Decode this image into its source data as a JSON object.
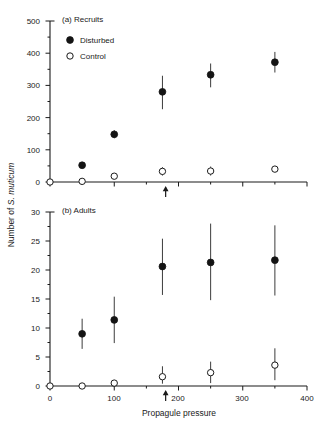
{
  "figure": {
    "xlabel": "Propagule pressure",
    "ylabel_prefix": "Number of ",
    "ylabel_species": "S. muticum",
    "legend": {
      "disturbed": "Disturbed",
      "control": "Control"
    },
    "colors": {
      "axis": "#1a1a1a",
      "disturbed_fill": "#141414",
      "control_fill": "#ffffff",
      "control_stroke": "#1a1a1a",
      "error_bar": "#3c3c3c",
      "background": "#ffffff"
    }
  },
  "chart_data": [
    {
      "type": "scatter",
      "panel": "a",
      "title": "(a) Recruits",
      "xlabel": "Propagule pressure",
      "ylabel": "Number of S. muticum",
      "xlim": [
        0,
        400
      ],
      "ylim": [
        0,
        500
      ],
      "xticks": [
        0,
        50,
        100,
        150,
        200,
        250,
        300,
        350,
        400
      ],
      "xticklabels": [
        "0",
        "",
        "100",
        "",
        "200",
        "",
        "300",
        "",
        "400"
      ],
      "yticks": [
        0,
        50,
        100,
        150,
        200,
        250,
        300,
        350,
        400,
        450,
        500
      ],
      "yticklabels": [
        "0",
        "",
        "100",
        "",
        "200",
        "",
        "300",
        "",
        "400",
        "",
        "500"
      ],
      "grid": false,
      "legend_position": "upper-left",
      "annotation_arrow_x": 180,
      "series": [
        {
          "name": "Disturbed",
          "marker": "filled-circle",
          "x": [
            50,
            100,
            175,
            250,
            350
          ],
          "values": [
            52,
            148,
            280,
            333,
            372
          ],
          "err_low": [
            44,
            136,
            226,
            294,
            340
          ],
          "err_high": [
            60,
            161,
            330,
            368,
            404
          ]
        },
        {
          "name": "Control",
          "marker": "open-circle",
          "x": [
            0,
            50,
            100,
            175,
            250,
            350
          ],
          "values": [
            0,
            2,
            18,
            33,
            34,
            40
          ],
          "err_low": [
            0,
            0,
            12,
            20,
            20,
            32
          ],
          "err_high": [
            0,
            6,
            24,
            46,
            48,
            48
          ]
        }
      ]
    },
    {
      "type": "scatter",
      "panel": "b",
      "title": "(b) Adults",
      "xlabel": "Propagule pressure",
      "ylabel": "Number of S. muticum",
      "xlim": [
        0,
        400
      ],
      "ylim": [
        0,
        30
      ],
      "xticks": [
        0,
        50,
        100,
        150,
        200,
        250,
        300,
        350,
        400
      ],
      "xticklabels": [
        "0",
        "",
        "100",
        "",
        "200",
        "",
        "300",
        "",
        "400"
      ],
      "yticks": [
        0,
        2.5,
        5,
        7.5,
        10,
        12.5,
        15,
        17.5,
        20,
        22.5,
        25,
        27.5,
        30
      ],
      "yticklabels": [
        "0",
        "",
        "5",
        "",
        "10",
        "",
        "15",
        "",
        "20",
        "",
        "25",
        "",
        "30"
      ],
      "grid": false,
      "legend_position": "none",
      "annotation_arrow_x": 180,
      "series": [
        {
          "name": "Disturbed",
          "marker": "filled-circle",
          "x": [
            50,
            100,
            175,
            250,
            350
          ],
          "values": [
            9.0,
            11.4,
            20.6,
            21.3,
            21.7
          ],
          "err_low": [
            6.4,
            7.4,
            15.7,
            14.8,
            15.6
          ],
          "err_high": [
            11.6,
            15.4,
            25.4,
            28.0,
            27.7
          ]
        },
        {
          "name": "Control",
          "marker": "open-circle",
          "x": [
            0,
            50,
            100,
            175,
            250,
            350
          ],
          "values": [
            0,
            0,
            0.5,
            1.6,
            2.3,
            3.6
          ],
          "err_low": [
            0,
            0,
            0,
            0.4,
            0.5,
            1.0
          ],
          "err_high": [
            0,
            0,
            1.0,
            3.4,
            4.2,
            6.5
          ]
        }
      ]
    }
  ],
  "axis_labels": {
    "panel_a_yticks": [
      "0",
      "100",
      "200",
      "300",
      "400",
      "500"
    ],
    "panel_b_yticks": [
      "0",
      "5",
      "10",
      "15",
      "20",
      "25",
      "30"
    ],
    "xticks": [
      "0",
      "100",
      "200",
      "300",
      "400"
    ]
  }
}
